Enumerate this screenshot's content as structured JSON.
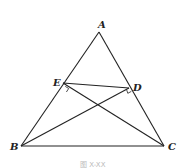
{
  "diagram": {
    "type": "geometry",
    "points": {
      "A": {
        "label": "A",
        "x": 99,
        "y": 32
      },
      "B": {
        "label": "B",
        "x": 21,
        "y": 146
      },
      "C": {
        "label": "C",
        "x": 164,
        "y": 146
      },
      "E": {
        "label": "E",
        "x": 63,
        "y": 83
      },
      "D": {
        "label": "D",
        "x": 129,
        "y": 88
      }
    },
    "segments": [
      "AB",
      "AC",
      "BC",
      "ED",
      "BD",
      "CE"
    ],
    "right_angles": [
      "E (CE ⊥ AB)",
      "D (BD ⊥ AC)"
    ],
    "stroke_color": "#222222"
  },
  "caption": "图 X-XX"
}
